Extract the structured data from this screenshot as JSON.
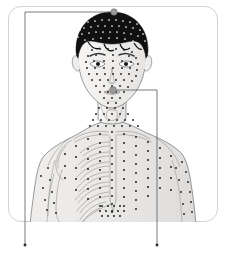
{
  "figure": {
    "view": "anterior",
    "frame": {
      "shape": "rounded-rectangle",
      "x": 8,
      "y": 6,
      "width": 210,
      "height": 216,
      "corner_radius": 13,
      "stroke_color": "#d2d2d2",
      "fill_color": "#ffffff"
    },
    "palette": {
      "background": "#ffffff",
      "frame_stroke": "#d2d2d2",
      "leader_line": "#58585a",
      "point_dark": "#2b2b2b",
      "point_light": "#ffffff",
      "marker_highlight": "#9a9a9a",
      "skin_shade": "#f0eeec",
      "skeleton_stroke": "#8c8c8c",
      "hair_fill": "#101010",
      "outline_stroke": "#6f6f6f"
    }
  },
  "callouts": [
    {
      "id": "callout-vertex",
      "name": "vertex-callout",
      "anchor_label": "vertex of scalp",
      "anchor": {
        "x": 114,
        "y": 12
      },
      "marker": {
        "shape": "circle",
        "radius": 3.2,
        "fill": "#9a9a9a",
        "stroke": "#6f6f6f"
      },
      "path": "horizontal-then-vertical",
      "elbow": {
        "x": 25,
        "y": 12
      },
      "terminus": {
        "x": 25,
        "y": 245
      },
      "terminus_dot": {
        "shape": "square",
        "size": 2.6,
        "fill": "#2b2b2b"
      }
    },
    {
      "id": "callout-cheek",
      "name": "cheek-callout",
      "anchor_label": "lateral cheek",
      "anchor": {
        "x": 113,
        "y": 90
      },
      "marker": {
        "shape": "circle",
        "radius": 3.4,
        "fill": "#9a9a9a",
        "stroke": "#6f6f6f"
      },
      "path": "horizontal-then-vertical",
      "elbow": {
        "x": 157,
        "y": 90
      },
      "terminus": {
        "x": 157,
        "y": 245
      },
      "terminus_dot": {
        "shape": "square",
        "size": 2.6,
        "fill": "#2b2b2b"
      }
    }
  ],
  "anatomy_regions": [
    {
      "id": "hair",
      "label": "hair / scalp",
      "render": "dark-fill-with-light-points"
    },
    {
      "id": "face",
      "label": "face",
      "render": "light-skin-with-dark-points"
    },
    {
      "id": "neck",
      "label": "neck and larynx",
      "render": "light-skin-with-dark-points"
    },
    {
      "id": "clavicle",
      "label": "clavicles",
      "render": "skeleton-outline"
    },
    {
      "id": "ribcage",
      "label": "ribcage (subject's right)",
      "render": "skeleton-outline"
    },
    {
      "id": "sternum",
      "label": "sternum",
      "render": "skeleton-outline"
    },
    {
      "id": "scapula",
      "label": "scapula and humerus",
      "render": "skeleton-outline"
    },
    {
      "id": "arm-left",
      "label": "subject's right arm",
      "render": "outline-with-bones"
    },
    {
      "id": "arm-right",
      "label": "subject's left arm",
      "render": "outline-with-points"
    },
    {
      "id": "abdomen",
      "label": "upper abdomen",
      "render": "light-skin-with-dark-points"
    }
  ],
  "point_groups": [
    {
      "id": "scalp-points",
      "label": "scalp points",
      "color": "#ffffff",
      "radius": 0.85,
      "points": [
        [
          88,
          22
        ],
        [
          95,
          21
        ],
        [
          102,
          20
        ],
        [
          109,
          20
        ],
        [
          116,
          20
        ],
        [
          123,
          21
        ],
        [
          130,
          22
        ],
        [
          137,
          24
        ],
        [
          84,
          28
        ],
        [
          91,
          27
        ],
        [
          98,
          26
        ],
        [
          105,
          26
        ],
        [
          112,
          26
        ],
        [
          119,
          26
        ],
        [
          126,
          27
        ],
        [
          133,
          28
        ],
        [
          140,
          30
        ],
        [
          82,
          34
        ],
        [
          89,
          33
        ],
        [
          96,
          32
        ],
        [
          103,
          32
        ],
        [
          110,
          32
        ],
        [
          117,
          32
        ],
        [
          124,
          33
        ],
        [
          131,
          34
        ],
        [
          138,
          36
        ],
        [
          85,
          40
        ],
        [
          93,
          39
        ],
        [
          101,
          38
        ],
        [
          109,
          38
        ],
        [
          117,
          38
        ],
        [
          125,
          39
        ],
        [
          133,
          41
        ],
        [
          80,
          30
        ],
        [
          143,
          34
        ],
        [
          78,
          37
        ],
        [
          145,
          41
        ]
      ]
    },
    {
      "id": "face-points",
      "label": "facial points",
      "color": "#2b2b2b",
      "radius": 1.0,
      "points": [
        [
          92,
          50
        ],
        [
          100,
          49
        ],
        [
          108,
          49
        ],
        [
          116,
          49
        ],
        [
          124,
          50
        ],
        [
          132,
          52
        ],
        [
          88,
          56
        ],
        [
          96,
          55
        ],
        [
          113,
          55
        ],
        [
          129,
          56
        ],
        [
          136,
          58
        ],
        [
          86,
          62
        ],
        [
          94,
          61
        ],
        [
          104,
          61
        ],
        [
          113,
          61
        ],
        [
          122,
          61
        ],
        [
          131,
          62
        ],
        [
          138,
          64
        ],
        [
          87,
          68
        ],
        [
          95,
          68
        ],
        [
          104,
          68
        ],
        [
          113,
          68
        ],
        [
          122,
          68
        ],
        [
          130,
          68
        ],
        [
          137,
          70
        ],
        [
          89,
          74
        ],
        [
          97,
          74
        ],
        [
          105,
          74
        ],
        [
          113,
          74
        ],
        [
          121,
          74
        ],
        [
          129,
          74
        ],
        [
          136,
          76
        ],
        [
          92,
          80
        ],
        [
          100,
          80
        ],
        [
          108,
          80
        ],
        [
          116,
          80
        ],
        [
          124,
          80
        ],
        [
          132,
          81
        ],
        [
          96,
          86
        ],
        [
          104,
          86
        ],
        [
          112,
          86
        ],
        [
          120,
          86
        ],
        [
          128,
          87
        ],
        [
          100,
          92
        ],
        [
          108,
          92
        ],
        [
          116,
          92
        ],
        [
          124,
          92
        ],
        [
          104,
          98
        ],
        [
          112,
          98
        ],
        [
          120,
          98
        ],
        [
          108,
          103
        ],
        [
          116,
          103
        ]
      ]
    },
    {
      "id": "neck-points",
      "label": "cervical points",
      "color": "#2b2b2b",
      "radius": 1.0,
      "points": [
        [
          99,
          108
        ],
        [
          107,
          108
        ],
        [
          115,
          108
        ],
        [
          123,
          108
        ],
        [
          96,
          114
        ],
        [
          104,
          114
        ],
        [
          112,
          114
        ],
        [
          120,
          114
        ],
        [
          128,
          114
        ],
        [
          93,
          120
        ],
        [
          101,
          120
        ],
        [
          109,
          120
        ],
        [
          117,
          120
        ],
        [
          125,
          120
        ],
        [
          133,
          120
        ],
        [
          90,
          126
        ],
        [
          98,
          126
        ],
        [
          106,
          126
        ],
        [
          114,
          126
        ],
        [
          122,
          126
        ],
        [
          130,
          126
        ],
        [
          138,
          126
        ]
      ]
    },
    {
      "id": "chest-midline",
      "label": "midline (ren / conception vessel) points",
      "color": "#2b2b2b",
      "radius": 1.05,
      "points": [
        [
          112,
          132
        ],
        [
          112,
          140
        ],
        [
          112,
          148
        ],
        [
          112,
          156
        ],
        [
          112,
          164
        ],
        [
          112,
          172
        ],
        [
          112,
          180
        ],
        [
          112,
          188
        ],
        [
          112,
          196
        ],
        [
          112,
          204
        ],
        [
          112,
          212
        ]
      ]
    },
    {
      "id": "chest-left-columns",
      "label": "subject's left parasternal and mammary line points",
      "color": "#2b2b2b",
      "radius": 1.05,
      "points": [
        [
          124,
          134
        ],
        [
          124,
          143
        ],
        [
          124,
          152
        ],
        [
          124,
          161
        ],
        [
          124,
          170
        ],
        [
          124,
          179
        ],
        [
          124,
          188
        ],
        [
          124,
          197
        ],
        [
          124,
          206
        ],
        [
          136,
          137
        ],
        [
          136,
          146
        ],
        [
          136,
          155
        ],
        [
          136,
          164
        ],
        [
          136,
          173
        ],
        [
          136,
          182
        ],
        [
          136,
          191
        ],
        [
          136,
          200
        ],
        [
          136,
          209
        ],
        [
          148,
          142
        ],
        [
          148,
          151
        ],
        [
          148,
          160
        ],
        [
          148,
          169
        ],
        [
          148,
          178
        ],
        [
          148,
          187
        ],
        [
          148,
          196
        ],
        [
          160,
          148
        ],
        [
          160,
          158
        ],
        [
          160,
          168
        ],
        [
          160,
          178
        ],
        [
          160,
          188
        ],
        [
          171,
          156
        ],
        [
          171,
          167
        ],
        [
          171,
          178
        ],
        [
          171,
          190
        ]
      ]
    },
    {
      "id": "chest-right-columns",
      "label": "subject's right parasternal points (over skeleton)",
      "color": "#2b2b2b",
      "radius": 1.05,
      "points": [
        [
          100,
          134
        ],
        [
          100,
          143
        ],
        [
          100,
          152
        ],
        [
          100,
          161
        ],
        [
          100,
          170
        ],
        [
          100,
          179
        ],
        [
          100,
          188
        ],
        [
          100,
          197
        ],
        [
          100,
          206
        ],
        [
          88,
          139
        ],
        [
          88,
          149
        ],
        [
          88,
          159
        ],
        [
          88,
          169
        ],
        [
          88,
          179
        ],
        [
          88,
          189
        ],
        [
          88,
          199
        ],
        [
          76,
          146
        ],
        [
          76,
          157
        ],
        [
          76,
          168
        ],
        [
          76,
          179
        ],
        [
          76,
          190
        ],
        [
          65,
          154
        ],
        [
          65,
          166
        ],
        [
          65,
          178
        ]
      ]
    },
    {
      "id": "abdomen-cluster",
      "label": "upper abdominal cluster",
      "color": "#2b2b2b",
      "radius": 1.05,
      "points": [
        [
          102,
          206
        ],
        [
          108,
          206
        ],
        [
          114,
          206
        ],
        [
          120,
          206
        ],
        [
          100,
          211
        ],
        [
          106,
          211
        ],
        [
          112,
          211
        ],
        [
          118,
          211
        ],
        [
          124,
          211
        ],
        [
          102,
          216
        ],
        [
          108,
          216
        ],
        [
          114,
          216
        ],
        [
          120,
          216
        ]
      ]
    },
    {
      "id": "arm-right-points",
      "label": "subject's left arm points",
      "color": "#2b2b2b",
      "radius": 1.0,
      "points": [
        [
          182,
          162
        ],
        [
          186,
          172
        ],
        [
          188,
          182
        ],
        [
          190,
          192
        ],
        [
          191,
          202
        ],
        [
          192,
          212
        ],
        [
          176,
          168
        ],
        [
          179,
          180
        ],
        [
          181,
          192
        ],
        [
          183,
          204
        ],
        [
          184,
          214
        ]
      ]
    },
    {
      "id": "arm-left-points",
      "label": "subject's right arm points",
      "color": "#2b2b2b",
      "radius": 1.0,
      "points": [
        [
          48,
          168
        ],
        [
          50,
          180
        ],
        [
          52,
          192
        ],
        [
          54,
          203
        ],
        [
          56,
          213
        ],
        [
          41,
          176
        ],
        [
          43,
          188
        ],
        [
          45,
          200
        ],
        [
          47,
          210
        ]
      ]
    }
  ]
}
